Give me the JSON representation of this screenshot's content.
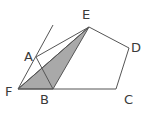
{
  "diagram": {
    "type": "geometry-figure",
    "points": [
      {
        "id": "E",
        "label": "E"
      },
      {
        "id": "D",
        "label": "D"
      },
      {
        "id": "C",
        "label": "C"
      },
      {
        "id": "B",
        "label": "B"
      },
      {
        "id": "A",
        "label": "A"
      },
      {
        "id": "F",
        "label": "F"
      }
    ],
    "polygon": [
      "A",
      "B",
      "C",
      "D",
      "E"
    ],
    "shaded_triangle": [
      "F",
      "B",
      "E"
    ],
    "segments": [
      [
        "F",
        "E"
      ],
      [
        "A",
        "B"
      ],
      [
        "A",
        "E"
      ],
      [
        "B",
        "E"
      ],
      [
        "F",
        "C"
      ]
    ],
    "ray": {
      "from": "F",
      "through": "A"
    },
    "colors": {
      "stroke": "#555555",
      "shade": "#a9a9a9",
      "label": "#3a3a3a"
    }
  }
}
